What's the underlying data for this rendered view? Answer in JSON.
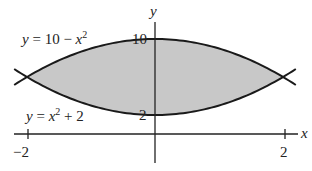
{
  "chart_data": {
    "type": "area",
    "title": "",
    "xlabel": "x",
    "ylabel": "y",
    "xlim": [
      -2.3,
      2.3
    ],
    "ylim": [
      0,
      11
    ],
    "grid": false,
    "legend": null,
    "x_ticks": [
      {
        "value": -2,
        "label": "−2"
      },
      {
        "value": 2,
        "label": "2"
      }
    ],
    "y_ticks": [
      {
        "value": 2,
        "label": "2"
      },
      {
        "value": 10,
        "label": "10"
      }
    ],
    "series": [
      {
        "name": "upper",
        "label": "y = 10 − x²",
        "expr": "10 - x^2",
        "x": [
          -2.2,
          -2,
          -1,
          0,
          1,
          2,
          2.2
        ],
        "values": [
          5.16,
          6,
          9,
          10,
          9,
          6,
          5.16
        ]
      },
      {
        "name": "lower",
        "label": "y = x² + 2",
        "expr": "x^2 + 2",
        "x": [
          -2.2,
          -2,
          -1,
          0,
          1,
          2,
          2.2
        ],
        "values": [
          6.84,
          6,
          3,
          2,
          3,
          6,
          6.84
        ]
      }
    ],
    "shaded_region": {
      "between": [
        "upper",
        "lower"
      ],
      "x_range": [
        -2,
        2
      ],
      "color": "#c8c8c8"
    },
    "annotations": [
      {
        "text": "y = 10 − x²",
        "near": "upper curve, left"
      },
      {
        "text": "y = x² + 2",
        "near": "lower curve, left"
      }
    ]
  },
  "labels": {
    "upper_curve": "y = 10 − x",
    "lower_curve": "y = x",
    "sup": "2",
    "lower_suffix": " + 2",
    "x_axis": "x",
    "y_axis": "y",
    "tick_neg2": "−2",
    "tick_2": "2",
    "ytick_10": "10",
    "ytick_2": "2"
  },
  "colors": {
    "shade": "#c8c8c8",
    "curve": "#1a1a1a",
    "axis": "#222222"
  }
}
